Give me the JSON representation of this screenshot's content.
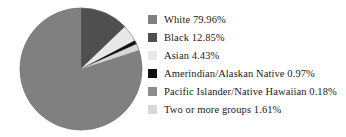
{
  "chart_data": {
    "type": "pie",
    "title": "",
    "subtitle": "",
    "xlabel": "",
    "ylabel": "",
    "legend_position": "right",
    "grid": false,
    "start_angle_deg": 0,
    "direction": "clockwise",
    "units": "percent",
    "categories": [
      "White",
      "Black",
      "Asian",
      "Amerindian/Alaskan Native",
      "Pacific Islander/Native Hawaiian",
      "Two or more groups"
    ],
    "values": [
      79.96,
      12.85,
      4.43,
      0.97,
      0.18,
      1.61
    ],
    "value_labels": [
      "79.96%",
      "12.85%",
      "4.43%",
      "0.97%",
      "0.18%",
      "1.61%"
    ],
    "colors": [
      "#808080",
      "#4f4f4f",
      "#e8e8e8",
      "#111111",
      "#8c8c8c",
      "#d8d8d8"
    ],
    "slices": [
      {
        "name": "White",
        "value": 79.96,
        "value_label": "79.96%",
        "color": "#808080",
        "legend_text": "White 79.96%"
      },
      {
        "name": "Black",
        "value": 12.85,
        "value_label": "12.85%",
        "color": "#4f4f4f",
        "legend_text": "Black 12.85%"
      },
      {
        "name": "Asian",
        "value": 4.43,
        "value_label": "4.43%",
        "color": "#e8e8e8",
        "legend_text": "Asian 4.43%"
      },
      {
        "name": "Amerindian/Alaskan Native",
        "value": 0.97,
        "value_label": "0.97%",
        "color": "#111111",
        "legend_text": "Amerindian/Alaskan Native 0.97%"
      },
      {
        "name": "Pacific Islander/Native Hawaiian",
        "value": 0.18,
        "value_label": "0.18%",
        "color": "#8c8c8c",
        "legend_text": "Pacific Islander/Native Hawaiian 0.18%"
      },
      {
        "name": "Two or more groups",
        "value": 1.61,
        "value_label": "1.61%",
        "color": "#d8d8d8",
        "legend_text": "Two or more groups 1.61%"
      }
    ]
  },
  "legend": {
    "items": [
      {
        "label": "White 79.96%",
        "color": "#808080",
        "swatch_name": "legend-swatch-white"
      },
      {
        "label": "Black 12.85%",
        "color": "#4f4f4f",
        "swatch_name": "legend-swatch-black"
      },
      {
        "label": "Asian 4.43%",
        "color": "#e8e8e8",
        "swatch_name": "legend-swatch-asian"
      },
      {
        "label": "Amerindian/Alaskan Native 0.97%",
        "color": "#111111",
        "swatch_name": "legend-swatch-amerindian"
      },
      {
        "label": "Pacific Islander/Native Hawaiian 0.18%",
        "color": "#8c8c8c",
        "swatch_name": "legend-swatch-pacific-islander"
      },
      {
        "label": "Two or more groups 1.61%",
        "color": "#d8d8d8",
        "swatch_name": "legend-swatch-two-or-more"
      }
    ]
  },
  "figure": {
    "background": "#ffffff",
    "pie_outline_color": "#707070"
  }
}
